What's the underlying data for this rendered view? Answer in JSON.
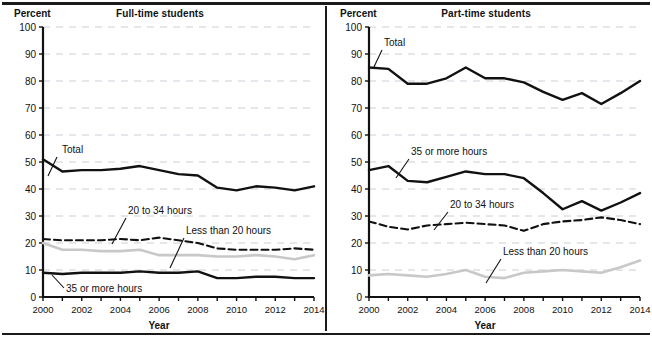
{
  "figure": {
    "axis_unit_label": "Percent",
    "xaxis_title": "Year"
  },
  "panels": [
    {
      "key": "full_time",
      "title": "Full-time students",
      "annotations": [
        {
          "name": "total",
          "label": "Total"
        },
        {
          "name": "20-to-34-hours",
          "label": "20 to 34 hours"
        },
        {
          "name": "less-than-20-hours",
          "label": "Less than 20 hours"
        },
        {
          "name": "35-or-more-hours",
          "label": "35 or more hours"
        }
      ]
    },
    {
      "key": "part_time",
      "title": "Part-time students",
      "annotations": [
        {
          "name": "total",
          "label": "Total"
        },
        {
          "name": "35-or-more-hours",
          "label": "35 or more hours"
        },
        {
          "name": "20-to-34-hours",
          "label": "20 to 34 hours"
        },
        {
          "name": "less-than-20-hours",
          "label": "Less than 20 hours"
        }
      ]
    }
  ],
  "colors": {
    "total_line": "#111111",
    "black_line": "#111111",
    "dashed_line": "#111111",
    "gray_line": "#c8c8c8",
    "gridline": "#c9cfd6",
    "axis": "#111111",
    "background": "#ffffff"
  },
  "chart_data": [
    {
      "type": "line",
      "title": "Full-time students",
      "xlabel": "Year",
      "ylabel": "Percent",
      "xlim": [
        2000,
        2014
      ],
      "ylim": [
        0,
        100
      ],
      "ytick_labels": [
        "0",
        "10",
        "20",
        "30",
        "40",
        "50",
        "60",
        "70",
        "80",
        "90",
        "100"
      ],
      "yticks": [
        0,
        10,
        20,
        30,
        40,
        50,
        60,
        70,
        80,
        90,
        100
      ],
      "xticks": [
        2000,
        2001,
        2002,
        2003,
        2004,
        2005,
        2006,
        2007,
        2008,
        2009,
        2010,
        2011,
        2012,
        2013,
        2014
      ],
      "xtick_labels": [
        "2000",
        "2002",
        "2004",
        "2006",
        "2008",
        "2010",
        "2012",
        "2014"
      ],
      "xtick_labeled_values": [
        2000,
        2002,
        2004,
        2006,
        2008,
        2010,
        2012,
        2014
      ],
      "grid": true,
      "grid_axis": "y",
      "legend": "inline-annotations",
      "x": [
        2000,
        2001,
        2002,
        2003,
        2004,
        2005,
        2006,
        2007,
        2008,
        2009,
        2010,
        2011,
        2012,
        2013,
        2014
      ],
      "series": [
        {
          "name": "Total",
          "style": "solid-thick",
          "color": "#111111",
          "values": [
            51,
            46.5,
            47,
            47,
            47.5,
            48.5,
            47,
            45.5,
            45,
            40.5,
            39.5,
            41,
            40.5,
            39.5,
            41
          ]
        },
        {
          "name": "20 to 34 hours",
          "style": "dashed",
          "color": "#111111",
          "values": [
            21.5,
            21,
            21,
            21,
            21.5,
            21,
            22,
            21,
            20,
            18,
            17.5,
            17.5,
            17.5,
            18,
            17.5
          ]
        },
        {
          "name": "Less than 20 hours",
          "style": "solid-gray",
          "color": "#c8c8c8",
          "values": [
            20,
            17.5,
            17.5,
            17,
            17,
            17.5,
            15.5,
            15.5,
            15.5,
            15,
            15,
            15.5,
            15,
            14,
            15.5
          ]
        },
        {
          "name": "35 or more hours",
          "style": "solid-thick",
          "color": "#111111",
          "values": [
            9,
            8.5,
            9,
            9,
            9,
            9.5,
            9,
            9,
            9.5,
            7,
            7,
            7.5,
            7.5,
            7,
            7
          ]
        }
      ]
    },
    {
      "type": "line",
      "title": "Part-time students",
      "xlabel": "Year",
      "ylabel": "Percent",
      "xlim": [
        2000,
        2014
      ],
      "ylim": [
        0,
        100
      ],
      "ytick_labels": [
        "0",
        "10",
        "20",
        "30",
        "40",
        "50",
        "60",
        "70",
        "80",
        "90",
        "100"
      ],
      "yticks": [
        0,
        10,
        20,
        30,
        40,
        50,
        60,
        70,
        80,
        90,
        100
      ],
      "xticks": [
        2000,
        2001,
        2002,
        2003,
        2004,
        2005,
        2006,
        2007,
        2008,
        2009,
        2010,
        2011,
        2012,
        2013,
        2014
      ],
      "xtick_labels": [
        "2000",
        "2002",
        "2004",
        "2006",
        "2008",
        "2010",
        "2012",
        "2014"
      ],
      "xtick_labeled_values": [
        2000,
        2002,
        2004,
        2006,
        2008,
        2010,
        2012,
        2014
      ],
      "grid": true,
      "grid_axis": "y",
      "legend": "inline-annotations",
      "x": [
        2000,
        2001,
        2002,
        2003,
        2004,
        2005,
        2006,
        2007,
        2008,
        2009,
        2010,
        2011,
        2012,
        2013,
        2014
      ],
      "series": [
        {
          "name": "Total",
          "style": "solid-thick",
          "color": "#111111",
          "values": [
            85,
            84.5,
            79,
            79,
            81,
            85,
            81,
            81,
            79.5,
            76,
            73,
            75.5,
            71.5,
            75.5,
            80
          ]
        },
        {
          "name": "35 or more hours",
          "style": "solid-thick",
          "color": "#111111",
          "values": [
            47,
            48.5,
            43,
            42.5,
            44.5,
            46.5,
            45.5,
            45.5,
            44,
            38.5,
            32.5,
            35.5,
            32,
            35,
            38.5
          ]
        },
        {
          "name": "20 to 34 hours",
          "style": "dashed",
          "color": "#111111",
          "values": [
            28,
            26,
            25,
            26.5,
            27,
            27.5,
            27,
            26.5,
            24.5,
            27,
            28,
            28.5,
            29.5,
            28.5,
            27
          ]
        },
        {
          "name": "Less than 20 hours",
          "style": "solid-gray",
          "color": "#c8c8c8",
          "values": [
            8,
            8.5,
            8,
            7.5,
            8.5,
            10,
            7.5,
            7,
            9,
            9.5,
            10,
            9.5,
            9,
            11,
            13.5
          ]
        }
      ]
    }
  ]
}
